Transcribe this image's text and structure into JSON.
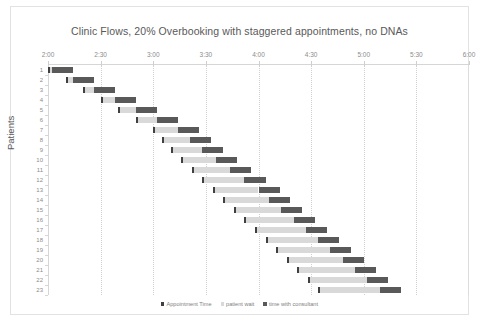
{
  "chart_data": {
    "type": "bar",
    "subtype": "stacked-horizontal-gantt",
    "title": "Clinic Flows, 20% Overbooking with staggered appointments, no DNAs",
    "xlabel": "",
    "ylabel": "Patients",
    "xlim": [
      120,
      360
    ],
    "x_tick_labels": [
      "2:00",
      "2:30",
      "3:00",
      "3:30",
      "4:00",
      "4:30",
      "5:00",
      "5:30",
      "6:00"
    ],
    "x_tick_values": [
      120,
      150,
      180,
      210,
      240,
      270,
      300,
      330,
      360
    ],
    "x_axis_note": "minutes from midnight; 2:00 PM = 120 through 6:00 PM = 360",
    "grid": "vertical dotted gridlines at each 30 minute tick",
    "legend_position": "bottom-center",
    "categories": [
      "1",
      "2",
      "3",
      "4",
      "5",
      "6",
      "7",
      "8",
      "9",
      "10",
      "11",
      "12",
      "13",
      "14",
      "15",
      "16",
      "17",
      "18",
      "19",
      "20",
      "21",
      "22",
      "23"
    ],
    "series": [
      {
        "name": "Appointment Time",
        "color": "#404040",
        "role": "start offset marker",
        "values": [
          120,
          130,
          140,
          150,
          160,
          170,
          180,
          185,
          190,
          196,
          202,
          208,
          214,
          220,
          226,
          232,
          238,
          244,
          250,
          256,
          262,
          268,
          274
        ]
      },
      {
        "name": "patient wait",
        "color": "#d9d9d9",
        "values": [
          2,
          4,
          6,
          8,
          10,
          12,
          14,
          16,
          18,
          20,
          22,
          24,
          26,
          26,
          27,
          28,
          29,
          30,
          31,
          32,
          33,
          34,
          35
        ]
      },
      {
        "name": "time with consultant",
        "color": "#595959",
        "values": [
          12,
          12,
          12,
          12,
          12,
          12,
          12,
          12,
          12,
          12,
          12,
          12,
          12,
          12,
          12,
          12,
          12,
          12,
          12,
          12,
          12,
          12,
          12
        ]
      }
    ],
    "rows": [
      {
        "patient": "1",
        "appointment_time": 120,
        "wait": 2,
        "consult": 12
      },
      {
        "patient": "2",
        "appointment_time": 130,
        "wait": 4,
        "consult": 12
      },
      {
        "patient": "3",
        "appointment_time": 140,
        "wait": 6,
        "consult": 12
      },
      {
        "patient": "4",
        "appointment_time": 150,
        "wait": 8,
        "consult": 12
      },
      {
        "patient": "5",
        "appointment_time": 160,
        "wait": 10,
        "consult": 12
      },
      {
        "patient": "6",
        "appointment_time": 170,
        "wait": 12,
        "consult": 12
      },
      {
        "patient": "7",
        "appointment_time": 180,
        "wait": 14,
        "consult": 12
      },
      {
        "patient": "8",
        "appointment_time": 185,
        "wait": 16,
        "consult": 12
      },
      {
        "patient": "9",
        "appointment_time": 190,
        "wait": 18,
        "consult": 12
      },
      {
        "patient": "10",
        "appointment_time": 196,
        "wait": 20,
        "consult": 12
      },
      {
        "patient": "11",
        "appointment_time": 202,
        "wait": 22,
        "consult": 12
      },
      {
        "patient": "12",
        "appointment_time": 208,
        "wait": 24,
        "consult": 12
      },
      {
        "patient": "13",
        "appointment_time": 214,
        "wait": 26,
        "consult": 12
      },
      {
        "patient": "14",
        "appointment_time": 220,
        "wait": 26,
        "consult": 12
      },
      {
        "patient": "15",
        "appointment_time": 226,
        "wait": 27,
        "consult": 12
      },
      {
        "patient": "16",
        "appointment_time": 232,
        "wait": 28,
        "consult": 12
      },
      {
        "patient": "17",
        "appointment_time": 238,
        "wait": 29,
        "consult": 12
      },
      {
        "patient": "18",
        "appointment_time": 244,
        "wait": 30,
        "consult": 12
      },
      {
        "patient": "19",
        "appointment_time": 250,
        "wait": 31,
        "consult": 12
      },
      {
        "patient": "20",
        "appointment_time": 256,
        "wait": 32,
        "consult": 12
      },
      {
        "patient": "21",
        "appointment_time": 262,
        "wait": 33,
        "consult": 12
      },
      {
        "patient": "22",
        "appointment_time": 268,
        "wait": 34,
        "consult": 12
      },
      {
        "patient": "23",
        "appointment_time": 274,
        "wait": 35,
        "consult": 12
      }
    ],
    "legend": [
      {
        "label": "Appointment Time",
        "color": "#404040"
      },
      {
        "label": "patient wait",
        "color": "#d9d9d9"
      },
      {
        "label": "time with consultant",
        "color": "#595959"
      }
    ]
  }
}
